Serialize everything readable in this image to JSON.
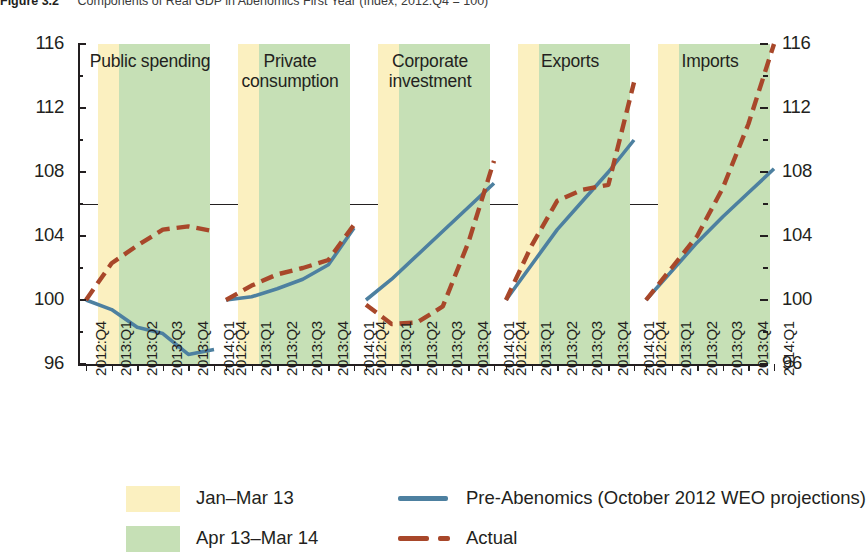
{
  "figure": {
    "number": "Figure 3.2",
    "title": "Components of Real GDP in Abenomics First Year (Index; 2012:Q4 = 100)"
  },
  "axes": {
    "y_ticks_major": [
      96,
      100,
      104,
      108,
      112,
      116
    ],
    "y_ticks_minor": [
      98,
      102,
      106,
      110,
      114
    ],
    "ylim": [
      96,
      116
    ],
    "x_categories": [
      "2012:Q4",
      "2013:Q1",
      "2013:Q2",
      "2013:Q3",
      "2013:Q4",
      "2014:Q1"
    ]
  },
  "legend": {
    "band_jan_mar": "Jan–Mar 13",
    "band_apr_mar": "Apr 13–Mar 14",
    "line_pre": "Pre-Abenomics (October 2012 WEO projections)",
    "line_actual": "Actual"
  },
  "colors": {
    "band_jan_mar": "#fbf0c0",
    "band_apr_mar": "#c6e0b6",
    "pre_abenomics": "#4d80a0",
    "actual": "#a8472a",
    "axis": "#231f20"
  },
  "chart_data": {
    "type": "line",
    "title": "Components of Real GDP in Abenomics First Year (Index; 2012:Q4 = 100)",
    "xlabel": "",
    "ylabel": "Index; 2012:Q4 = 100",
    "ylim": [
      96,
      116
    ],
    "grid": false,
    "legend_position": "bottom",
    "x": [
      "2012:Q4",
      "2013:Q1",
      "2013:Q2",
      "2013:Q3",
      "2013:Q4",
      "2014:Q1"
    ],
    "shaded_regions": [
      {
        "label": "Jan–Mar 13",
        "color": "#fbf0c0",
        "from": "2012:Q4",
        "to": "2013:Q1"
      },
      {
        "label": "Apr 13–Mar 14",
        "color": "#c6e0b6",
        "from": "2013:Q1",
        "to": "2014:Q1"
      }
    ],
    "panels": [
      {
        "name": "Public spending",
        "series": [
          {
            "name": "Pre-Abenomics (October 2012 WEO projections)",
            "style": "solid",
            "color": "#4d80a0",
            "values": [
              100.0,
              99.4,
              98.3,
              97.9,
              96.6,
              96.9
            ]
          },
          {
            "name": "Actual",
            "style": "dashed",
            "color": "#a8472a",
            "values": [
              100.0,
              102.3,
              103.4,
              104.4,
              104.6,
              104.3
            ]
          }
        ]
      },
      {
        "name": "Private consumption",
        "series": [
          {
            "name": "Pre-Abenomics (October 2012 WEO projections)",
            "style": "solid",
            "color": "#4d80a0",
            "values": [
              100.0,
              100.2,
              100.7,
              101.3,
              102.2,
              104.5
            ]
          },
          {
            "name": "Actual",
            "style": "dashed",
            "color": "#a8472a",
            "values": [
              100.0,
              100.9,
              101.6,
              102.0,
              102.5,
              104.7
            ]
          }
        ]
      },
      {
        "name": "Corporate investment",
        "series": [
          {
            "name": "Pre-Abenomics (October 2012 WEO projections)",
            "style": "solid",
            "color": "#4d80a0",
            "values": [
              100.0,
              101.3,
              102.8,
              104.3,
              105.8,
              107.3
            ]
          },
          {
            "name": "Actual",
            "style": "dashed",
            "color": "#a8472a",
            "values": [
              99.7,
              98.5,
              98.6,
              99.6,
              103.6,
              108.7
            ]
          }
        ]
      },
      {
        "name": "Exports",
        "series": [
          {
            "name": "Pre-Abenomics (October 2012 WEO projections)",
            "style": "solid",
            "color": "#4d80a0",
            "values": [
              100.0,
              102.2,
              104.4,
              106.2,
              108.0,
              110.0
            ]
          },
          {
            "name": "Actual",
            "style": "dashed",
            "color": "#a8472a",
            "values": [
              100.0,
              103.4,
              106.2,
              106.9,
              107.2,
              113.6
            ]
          }
        ]
      },
      {
        "name": "Imports",
        "series": [
          {
            "name": "Pre-Abenomics (October 2012 WEO projections)",
            "style": "solid",
            "color": "#4d80a0",
            "values": [
              100.0,
              101.8,
              103.6,
              105.2,
              106.7,
              108.2
            ]
          },
          {
            "name": "Actual",
            "style": "dashed",
            "color": "#a8472a",
            "values": [
              100.0,
              102.0,
              104.0,
              107.0,
              111.0,
              116.0
            ]
          }
        ]
      }
    ]
  }
}
